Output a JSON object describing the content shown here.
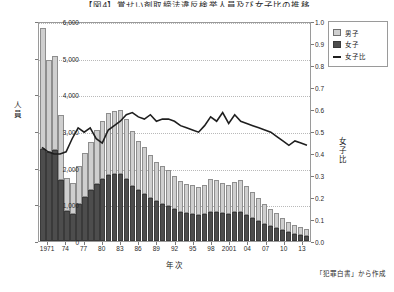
{
  "chart_data": {
    "type": "bar",
    "title": "【図4】覚せい剤取締法違反検挙人員及び女子比の推移",
    "xlabel": "年次",
    "ylabel": "人員",
    "y2label": "女子比",
    "ylim": [
      0,
      6000
    ],
    "y2lim": [
      0.0,
      1.0
    ],
    "grid": true,
    "legend_position": "top-right",
    "source_note": "「犯罪白書」から作成",
    "yticks": [
      "0",
      "1,000",
      "2,000",
      "3,000",
      "4,000",
      "5,000",
      "6,000"
    ],
    "y2ticks": [
      "0.0",
      "0.1",
      "0.2",
      "0.3",
      "0.4",
      "0.5",
      "0.6",
      "0.7",
      "0.8",
      "0.9",
      "1.0"
    ],
    "categories": [
      "1970",
      "1971",
      "1972",
      "1973",
      "1974",
      "1975",
      "1976",
      "1977",
      "1978",
      "1979",
      "1980",
      "1981",
      "1982",
      "1983",
      "1984",
      "1985",
      "1986",
      "1987",
      "1988",
      "1989",
      "1990",
      "1991",
      "1992",
      "1993",
      "1994",
      "1995",
      "1996",
      "1997",
      "1998",
      "1999",
      "2000",
      "2001",
      "2002",
      "2003",
      "2004",
      "2005",
      "2006",
      "2007",
      "2008",
      "2009",
      "2010",
      "2011",
      "2012",
      "2013",
      "2014"
    ],
    "xtick_labels": [
      "1971",
      "74",
      "77",
      "80",
      "83",
      "86",
      "89",
      "92",
      "95",
      "98",
      "2001",
      "04",
      "07",
      "10",
      "13"
    ],
    "xtick_indices": [
      1,
      4,
      7,
      10,
      13,
      16,
      19,
      22,
      25,
      28,
      31,
      34,
      37,
      40,
      43
    ],
    "series": [
      {
        "name": "男子",
        "color": "#cfcfcf",
        "stack": "total",
        "values": [
          3300,
          2520,
          2580,
          1780,
          900,
          840,
          1050,
          1200,
          1320,
          1480,
          1580,
          1700,
          1720,
          1740,
          1640,
          1480,
          1360,
          1280,
          1170,
          1080,
          1030,
          980,
          900,
          840,
          800,
          780,
          760,
          800,
          900,
          870,
          830,
          800,
          840,
          860,
          790,
          700,
          620,
          540,
          470,
          420,
          340,
          280,
          230,
          200,
          180
        ]
      },
      {
        "name": "女子",
        "color": "#4d4d4d",
        "stack": "total",
        "values": [
          2500,
          2430,
          2470,
          1670,
          830,
          750,
          1000,
          1200,
          1380,
          1560,
          1680,
          1800,
          1830,
          1840,
          1700,
          1510,
          1380,
          1290,
          1180,
          1080,
          1010,
          950,
          860,
          790,
          760,
          740,
          720,
          740,
          800,
          790,
          760,
          740,
          780,
          800,
          720,
          640,
          550,
          470,
          400,
          350,
          290,
          240,
          200,
          170,
          150
        ]
      }
    ],
    "line_series": {
      "name": "女子比",
      "color": "#1f1f1f",
      "axis": "y2",
      "values": [
        0.43,
        0.41,
        0.4,
        0.4,
        0.41,
        0.47,
        0.52,
        0.5,
        0.52,
        0.47,
        0.45,
        0.51,
        0.53,
        0.55,
        0.58,
        0.59,
        0.57,
        0.56,
        0.58,
        0.55,
        0.56,
        0.56,
        0.55,
        0.53,
        0.52,
        0.51,
        0.5,
        0.53,
        0.57,
        0.55,
        0.59,
        0.54,
        0.58,
        0.55,
        0.54,
        0.53,
        0.52,
        0.51,
        0.5,
        0.48,
        0.46,
        0.44,
        0.46,
        0.45,
        0.44
      ]
    }
  },
  "legend": {
    "items": [
      {
        "label": "男子",
        "type": "swatch-light"
      },
      {
        "label": "女子",
        "type": "swatch-dark"
      },
      {
        "label": "女子比",
        "type": "line"
      }
    ]
  }
}
